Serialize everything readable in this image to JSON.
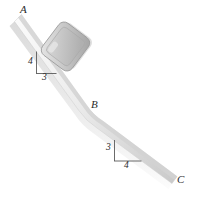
{
  "figure": {
    "background_color": "#ffffff",
    "ramp_fill_light": "#f2f2f2",
    "ramp_fill_mid": "#dcdcdc",
    "ramp_fill_dark": "#bdbdbd",
    "block_fill": "#c8c8c8",
    "block_edge": "#9a9a9a",
    "line_color": "#555555",
    "label_color": "#2b2b2b"
  },
  "points": {
    "A": {
      "label": "A",
      "description": "top of upper incline"
    },
    "B": {
      "label": "B",
      "description": "bend between inclines"
    },
    "C": {
      "label": "C",
      "description": "bottom of lower incline"
    }
  },
  "slope_triangles": {
    "upper": {
      "rise_label": "4",
      "run_label": "3",
      "rise": 4,
      "run": 3,
      "description": "steeper section A to B, rise 4 over run 3"
    },
    "lower": {
      "rise_label": "3",
      "run_label": "4",
      "rise": 3,
      "run": 4,
      "description": "shallower section B to C, rise 3 over run 4"
    }
  },
  "block": {
    "name": "block",
    "description": "rounded square block resting on upper incline",
    "rotation_deg": -53
  }
}
